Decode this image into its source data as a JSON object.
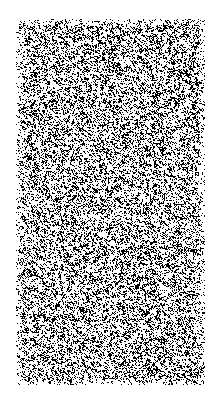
{
  "image": {
    "kind": "noise-texture",
    "description": "Random black and white one-bit noise field on a white page background",
    "width": 214,
    "height": 393,
    "background_color": "#ffffff",
    "foreground_color": "#000000"
  },
  "noise_field": {
    "name": "random-binary-noise",
    "offset_x": 16,
    "offset_y": 19,
    "width": 189,
    "height": 366,
    "dot_size": 1,
    "black_coverage": 0.27,
    "seed": 20240517,
    "edge_fade": {
      "enabled": true,
      "margin": 7,
      "min_density_scale": 0.35
    },
    "clustering": {
      "enabled": true,
      "neighbor_bias": 0.22
    }
  },
  "margins": {
    "left": 16,
    "right": 9,
    "top": 19,
    "bottom": 8
  }
}
